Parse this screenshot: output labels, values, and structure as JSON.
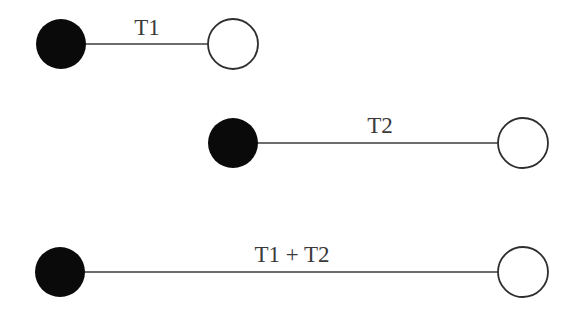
{
  "diagram": {
    "type": "timeline-segments",
    "node_radius": 25,
    "colors": {
      "filled_node": "#0a0a0a",
      "open_node_stroke": "#2e2e2e",
      "edge": "#3c3c3c",
      "label": "#3a3a3a",
      "background": "#ffffff"
    },
    "rows": [
      {
        "label": "T1",
        "start": {
          "x": 61,
          "y": 44,
          "style": "filled"
        },
        "end": {
          "x": 233,
          "y": 44,
          "style": "open"
        },
        "label_pos": {
          "x": 147,
          "y": 35
        }
      },
      {
        "label": "T2",
        "start": {
          "x": 233,
          "y": 143,
          "style": "filled"
        },
        "end": {
          "x": 523,
          "y": 143,
          "style": "open"
        },
        "label_pos": {
          "x": 380,
          "y": 133
        }
      },
      {
        "label": "T1 + T2",
        "start": {
          "x": 60,
          "y": 272,
          "style": "filled"
        },
        "end": {
          "x": 523,
          "y": 272,
          "style": "open"
        },
        "label_pos": {
          "x": 292,
          "y": 262
        }
      }
    ]
  }
}
